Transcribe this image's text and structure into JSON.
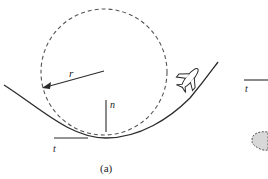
{
  "figure": {
    "caption": "(a)",
    "labels": {
      "radius": "r",
      "normal": "n",
      "tangent": "t",
      "tangent_partial_panel": "t"
    },
    "colors": {
      "line": "#2a2a2a",
      "dashed": "#555555",
      "blob_fill": "#d8d8d8",
      "background": "#ffffff"
    },
    "elements": [
      "dashed-curvature-circle",
      "solid-path-curve",
      "radius-arrow",
      "normal-vector-line",
      "tangent-vector-line",
      "airplane-icon",
      "partial-panel-tangent-line",
      "partial-panel-shaded-blob"
    ]
  }
}
